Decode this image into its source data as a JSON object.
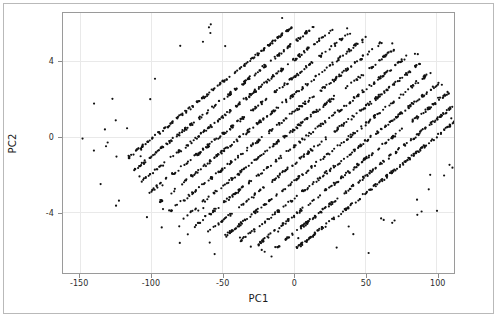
{
  "figure": {
    "background_color": "#ffffff",
    "panel_border_color": "#9a9a9a",
    "outer_border_color": "#b9b9b9",
    "grid_color": "#e9e9e9",
    "point_color": "#111111"
  },
  "chart_data": {
    "type": "scatter",
    "title": "",
    "xlabel": "PC1",
    "ylabel": "PC2",
    "xlim": [
      -162,
      112
    ],
    "ylim": [
      -7.2,
      6.6
    ],
    "xticks": [
      -150,
      -100,
      -50,
      0,
      50,
      100
    ],
    "xticklabels": [
      "-150",
      "-100",
      "-50",
      "0",
      "50",
      "100"
    ],
    "yticks": [
      4,
      0,
      -4
    ],
    "yticklabels": [
      "4",
      "0",
      "-4"
    ],
    "grid": true,
    "legend": null,
    "marker": "circle",
    "marker_size_px": 2.2,
    "structure": {
      "stripe_count": 14,
      "stripe_slope_units_pc2_per_pc1": 0.0605,
      "stripe_spacing_pc2_intercept": 0.92,
      "intercept_start": -6.0,
      "stripe_halfwidth_pc2": 0.085,
      "points_per_stripe": 150,
      "envelope_semi_axis_pc1": 118,
      "envelope_semi_axis_pc2": 5.9,
      "envelope_rotation_deg": 0,
      "outlier_count": 70
    },
    "series": [
      {
        "name": "samples",
        "color": "#111111",
        "n_points": 2170
      }
    ]
  }
}
